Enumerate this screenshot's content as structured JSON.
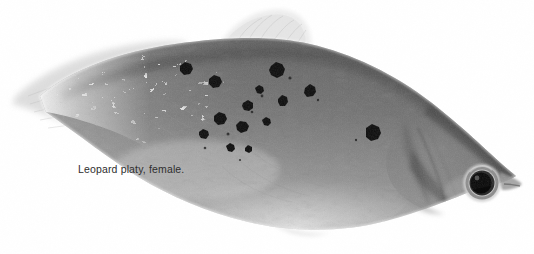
{
  "image": {
    "kind": "photograph",
    "subject": "leopard-platy-fish",
    "orientation": "facing-right",
    "palette": "black-and-white",
    "background_color": "#ffffff",
    "body_color_mid": "#6f6f6f",
    "body_color_dark": "#4a4a4a",
    "body_color_light": "#b9b9b9",
    "belly_color": "#c9c9c9",
    "spot_color": "#101010",
    "fin_color": "#e0e0e0",
    "eye_pupil_color": "#0d0d0d",
    "eye_iris_color": "#9a9a9a",
    "eye_ring_color": "#d8d8d8",
    "width": 534,
    "height": 254
  },
  "caption": {
    "text": "Leopard platy, female.",
    "color": "#2e2e2e",
    "x": 78,
    "y": 163
  },
  "anatomy": {
    "caudal_fin_label": "caudal-fin",
    "dorsal_fin_label": "dorsal-fin",
    "anal_fin_label": "anal-fin",
    "eye_label": "eye",
    "snout_label": "snout",
    "operculum_label": "gill-cover",
    "body_label": "body"
  }
}
